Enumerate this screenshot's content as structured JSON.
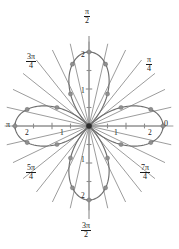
{
  "figure": {
    "kind": "polar-plot",
    "background": "#ffffff",
    "curve_color": "#6e6e6e",
    "dot_color": "#8f8f8f",
    "axis_color": "#8c8c8c",
    "radial_color": "#4a4a4a"
  },
  "angle_labels": {
    "right": "0",
    "upper_right_num": "π",
    "upper_right_den": "4",
    "top_num": "π",
    "top_den": "2",
    "upper_left_num": "3π",
    "upper_left_den": "4",
    "left": "π",
    "lower_left_num": "5π",
    "lower_left_den": "4",
    "bottom_num": "3π",
    "bottom_den": "2",
    "lower_right_num": "7π",
    "lower_right_den": "4"
  },
  "radial_ticks": {
    "right_1": "1",
    "right_2": "2",
    "left_1": "1",
    "left_2": "2",
    "top_1": "1",
    "top_2": "2",
    "bottom_1": "1",
    "bottom_2": "2"
  },
  "chart_data": {
    "type": "line",
    "title": "",
    "coordinate_system": "polar",
    "curve_equation": "r = 2 cos(2θ)",
    "petal_count": 4,
    "r_max": 2,
    "rlim": [
      0,
      2
    ],
    "theta_range_deg": [
      0,
      360
    ],
    "r_tick_values": [
      1,
      2
    ],
    "r_tick_labels": [
      "1",
      "2"
    ],
    "theta_tick_values_rad": [
      0,
      0.7853981634,
      1.5707963268,
      2.3561944902,
      3.1415926536,
      3.926990817,
      4.7123889804,
      5.4977871438
    ],
    "theta_tick_labels": [
      "0",
      "π/4",
      "π/2",
      "3π/4",
      "π",
      "5π/4",
      "3π/2",
      "7π/4"
    ],
    "petal_axis_angles_deg": [
      0,
      90,
      180,
      270
    ],
    "petal_peak_radius": 2,
    "grid": false,
    "legend": "none",
    "radial_sample_lines": {
      "count": 28,
      "angles_deg": [
        0,
        12.857,
        25.714,
        38.571,
        51.429,
        64.286,
        77.143,
        90,
        102.857,
        115.714,
        128.571,
        141.429,
        154.286,
        167.143,
        180,
        192.857,
        205.714,
        218.571,
        231.429,
        244.286,
        257.143,
        270,
        282.857,
        295.714,
        308.571,
        321.429,
        334.286,
        347.143
      ],
      "extends_beyond_curve": true
    },
    "sample_points": [
      {
        "theta_deg": 0,
        "r": 2.0
      },
      {
        "theta_deg": 15,
        "r": 1.73
      },
      {
        "theta_deg": 30,
        "r": 1.0
      },
      {
        "theta_deg": 60,
        "r": 1.0
      },
      {
        "theta_deg": 75,
        "r": 1.73
      },
      {
        "theta_deg": 90,
        "r": 2.0
      },
      {
        "theta_deg": 105,
        "r": 1.73
      },
      {
        "theta_deg": 120,
        "r": 1.0
      },
      {
        "theta_deg": 150,
        "r": 1.0
      },
      {
        "theta_deg": 165,
        "r": 1.73
      },
      {
        "theta_deg": 180,
        "r": 2.0
      },
      {
        "theta_deg": 195,
        "r": 1.73
      },
      {
        "theta_deg": 210,
        "r": 1.0
      },
      {
        "theta_deg": 240,
        "r": 1.0
      },
      {
        "theta_deg": 255,
        "r": 1.73
      },
      {
        "theta_deg": 270,
        "r": 2.0
      },
      {
        "theta_deg": 285,
        "r": 1.73
      },
      {
        "theta_deg": 300,
        "r": 1.0
      },
      {
        "theta_deg": 330,
        "r": 1.0
      },
      {
        "theta_deg": 345,
        "r": 1.73
      }
    ]
  }
}
